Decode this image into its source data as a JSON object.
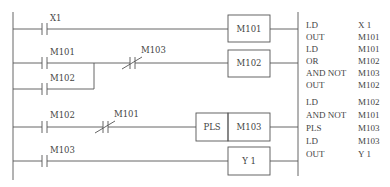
{
  "ladder": {
    "rungs": [
      {
        "contacts": [
          {
            "label": "X1",
            "type": "NO"
          }
        ],
        "coil": "M101"
      },
      {
        "contacts": [
          {
            "label": "M101",
            "type": "NO"
          },
          {
            "label": "M103",
            "type": "NC"
          }
        ],
        "branch": {
          "label": "M102",
          "type": "NO"
        },
        "coil": "M102"
      },
      {
        "contacts": [
          {
            "label": "M102",
            "type": "NO"
          },
          {
            "label": "M101",
            "type": "NC"
          }
        ],
        "coil_func": "PLS",
        "coil": "M103"
      },
      {
        "contacts": [
          {
            "label": "M103",
            "type": "NO"
          }
        ],
        "coil": "Y 1"
      }
    ]
  },
  "instructions": [
    {
      "op": "LD",
      "arg": "X   1"
    },
    {
      "op": "OUT",
      "arg": "M101"
    },
    {
      "op": "LD",
      "arg": "M101"
    },
    {
      "op": "OR",
      "arg": "M102"
    },
    {
      "op": "AND NOT",
      "arg": "M103"
    },
    {
      "op": "OUT",
      "arg": "M102"
    },
    {
      "op": "LD",
      "arg": "M102"
    },
    {
      "op": "AND NOT",
      "arg": "M101"
    },
    {
      "op": "PLS",
      "arg": "M103"
    },
    {
      "op": "LD",
      "arg": "M103"
    },
    {
      "op": "OUT",
      "arg": "Y   1"
    }
  ]
}
